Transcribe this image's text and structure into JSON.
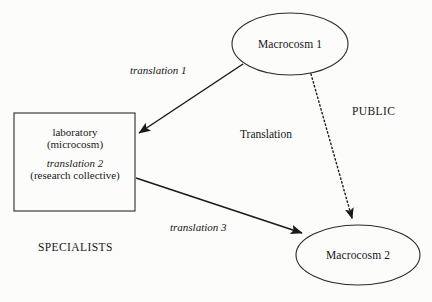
{
  "figure": {
    "background_color": "#fcfcfb",
    "stroke_color": "#1a1a1a",
    "width": 432,
    "height": 302
  },
  "nodes": {
    "macrocosm1": {
      "label": "Macrocosm 1",
      "shape": "ellipse",
      "cx": 290,
      "cy": 44,
      "rx": 58,
      "ry": 31
    },
    "macrocosm2": {
      "label": "Macrocosm 2",
      "shape": "ellipse",
      "cx": 358,
      "cy": 255,
      "rx": 62,
      "ry": 30
    },
    "laboratory": {
      "shape": "rectangle",
      "x": 14,
      "y": 113,
      "width": 121,
      "height": 98,
      "line1": "laboratory",
      "line2": "(microcosm)",
      "line3": "translation 2",
      "line3_style": "italic",
      "line4": "(research collective)"
    }
  },
  "edges": {
    "translation1": {
      "label": "translation 1",
      "style": "solid",
      "from": "macrocosm1",
      "to": "laboratory",
      "label_style": "italic"
    },
    "translation3": {
      "label": "translation 3",
      "style": "solid",
      "from": "laboratory",
      "to": "macrocosm2",
      "label_style": "italic"
    },
    "public_translation": {
      "label": "Translation",
      "style": "dotted",
      "from": "macrocosm1",
      "to": "macrocosm2",
      "label_style": "regular"
    }
  },
  "annotations": {
    "public": "PUBLIC",
    "specialists": "SPECIALISTS"
  }
}
